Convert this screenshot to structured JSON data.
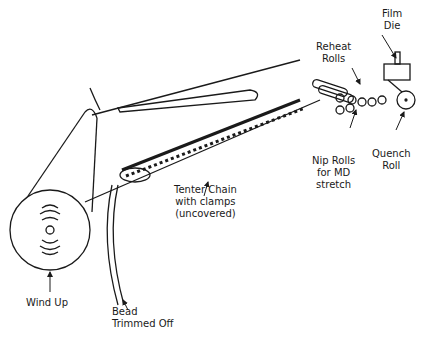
{
  "diagram": {
    "type": "process-schematic",
    "labels": {
      "film_die": "Film\nDie",
      "reheat_rolls": "Reheat\nRolls",
      "quench_roll": "Quench\nRoll",
      "nip_rolls": "Nip Rolls\nfor MD\nstretch",
      "tenter_chain": "Tenter Chain\nwith clamps\n(uncovered)",
      "wind_up": "Wind Up",
      "bead_trimmed": "Bead\nTrimmed Off"
    },
    "caption": ""
  },
  "colors": {
    "line": "#1a1a1a",
    "background": "#ffffff"
  }
}
